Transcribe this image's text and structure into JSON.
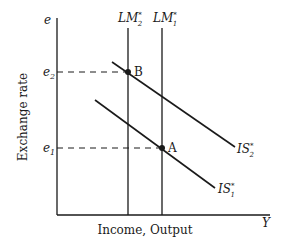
{
  "diagram": {
    "title": "",
    "y_axis": {
      "symbol": "e",
      "label": "Exchange rate"
    },
    "x_axis": {
      "symbol": "Y",
      "label": "Income, Output"
    },
    "levels": [
      {
        "id": "e2",
        "base": "e",
        "sub": "2"
      },
      {
        "id": "e1",
        "base": "e",
        "sub": "1"
      }
    ],
    "curves": {
      "lm2": {
        "base": "LM",
        "sup": "*",
        "sub": "2"
      },
      "lm1": {
        "base": "LM",
        "sup": "*",
        "sub": "1"
      },
      "is2": {
        "base": "IS",
        "sup": "*",
        "sub": "2"
      },
      "is1": {
        "base": "IS",
        "sup": "*",
        "sub": "1"
      }
    },
    "points": {
      "a": {
        "label": "A"
      },
      "b": {
        "label": "B"
      }
    },
    "colors": {
      "line": "#1a1a1a",
      "background": "#ffffff"
    }
  }
}
